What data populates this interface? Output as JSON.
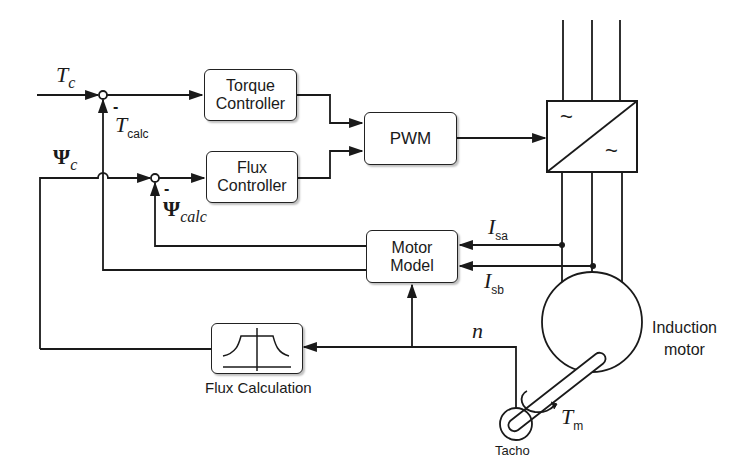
{
  "diagram": {
    "type": "block-diagram"
  },
  "signals": {
    "torque_ref": {
      "symbol": "T",
      "sub": "c"
    },
    "torque_calc": {
      "symbol": "T",
      "sub": "calc",
      "sign": "-"
    },
    "flux_ref": {
      "symbol": "Ψ",
      "sub": "c"
    },
    "flux_calc": {
      "symbol": "Ψ",
      "sub": "calc",
      "sign": "-"
    },
    "current_a": {
      "symbol": "I",
      "sub": "sa"
    },
    "current_b": {
      "symbol": "I",
      "sub": "sb"
    },
    "speed": {
      "symbol": "n"
    },
    "load_torque": {
      "symbol": "T",
      "sub": "m"
    }
  },
  "blocks": {
    "torque_controller": {
      "line1": "Torque",
      "line2": "Controller"
    },
    "flux_controller": {
      "line1": "Flux",
      "line2": "Controller"
    },
    "pwm": {
      "label": "PWM"
    },
    "converter": {
      "ac_in": "~",
      "ac_out": "~"
    },
    "motor_model": {
      "line1": "Motor",
      "line2": "Model"
    },
    "flux_calculation": {
      "label": "Flux Calculation"
    },
    "induction_motor": {
      "line1": "Induction",
      "line2": "motor"
    },
    "tacho": {
      "label": "Tacho"
    }
  },
  "colors": {
    "line": "#1a1a1a",
    "background": "#ffffff"
  }
}
